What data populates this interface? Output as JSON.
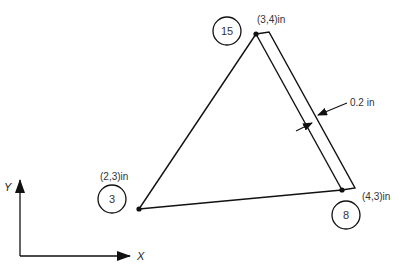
{
  "diagram": {
    "type": "triangular finite element with thickness",
    "nodes": [
      {
        "id": "15",
        "coord_label": "(3,4)in"
      },
      {
        "id": "3",
        "coord_label": "(2,3)in"
      },
      {
        "id": "8",
        "coord_label": "(4,3)in"
      }
    ],
    "thickness_label": "0.2 in",
    "axes": {
      "x_label": "X",
      "y_label": "Y"
    },
    "colors": {
      "line": "#111111",
      "text": "#333333",
      "background": "#ffffff"
    }
  }
}
